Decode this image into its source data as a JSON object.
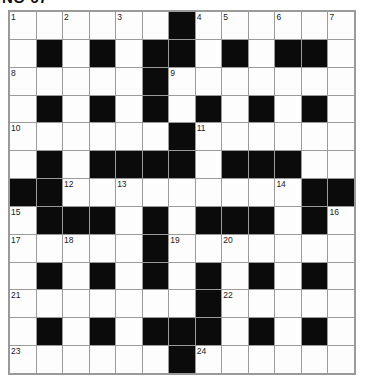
{
  "header": {
    "fragment_text": "NO 67"
  },
  "puzzle": {
    "type": "crossword-grid",
    "rows": 13,
    "cols": 13,
    "colors": {
      "block": "#0b0b0b",
      "cell": "#fdfdfd",
      "grid_line": "#9a9a9a",
      "number": "#1a1a1a"
    },
    "grid": [
      [
        0,
        0,
        0,
        0,
        0,
        0,
        1,
        0,
        0,
        0,
        0,
        0,
        0
      ],
      [
        0,
        1,
        0,
        1,
        0,
        1,
        1,
        0,
        1,
        0,
        1,
        1,
        0
      ],
      [
        0,
        0,
        0,
        0,
        0,
        1,
        0,
        0,
        0,
        0,
        0,
        0,
        0
      ],
      [
        0,
        1,
        0,
        1,
        0,
        1,
        0,
        1,
        0,
        1,
        0,
        1,
        0
      ],
      [
        0,
        0,
        0,
        0,
        0,
        0,
        1,
        0,
        0,
        0,
        0,
        0,
        0
      ],
      [
        0,
        1,
        0,
        1,
        1,
        1,
        1,
        0,
        1,
        1,
        1,
        0,
        0
      ],
      [
        1,
        1,
        0,
        0,
        0,
        0,
        0,
        0,
        0,
        0,
        0,
        1,
        1
      ],
      [
        0,
        1,
        1,
        1,
        0,
        1,
        0,
        1,
        1,
        1,
        0,
        1,
        0
      ],
      [
        0,
        0,
        0,
        0,
        0,
        1,
        0,
        0,
        0,
        0,
        0,
        0,
        0
      ],
      [
        0,
        1,
        0,
        1,
        0,
        1,
        0,
        1,
        0,
        1,
        0,
        1,
        0
      ],
      [
        0,
        0,
        0,
        0,
        0,
        0,
        0,
        1,
        0,
        0,
        0,
        0,
        0
      ],
      [
        0,
        1,
        0,
        1,
        0,
        1,
        1,
        1,
        0,
        1,
        0,
        1,
        0
      ],
      [
        0,
        0,
        0,
        0,
        0,
        0,
        1,
        0,
        0,
        0,
        0,
        0,
        0
      ]
    ],
    "numbers": [
      {
        "n": 1,
        "row": 0,
        "col": 0
      },
      {
        "n": 2,
        "row": 0,
        "col": 2
      },
      {
        "n": 3,
        "row": 0,
        "col": 4
      },
      {
        "n": 4,
        "row": 0,
        "col": 7
      },
      {
        "n": 5,
        "row": 0,
        "col": 8
      },
      {
        "n": 6,
        "row": 0,
        "col": 10
      },
      {
        "n": 7,
        "row": 0,
        "col": 12
      },
      {
        "n": 8,
        "row": 2,
        "col": 0
      },
      {
        "n": 9,
        "row": 2,
        "col": 6
      },
      {
        "n": 10,
        "row": 4,
        "col": 0
      },
      {
        "n": 11,
        "row": 4,
        "col": 7
      },
      {
        "n": 12,
        "row": 6,
        "col": 2
      },
      {
        "n": 13,
        "row": 6,
        "col": 4
      },
      {
        "n": 14,
        "row": 6,
        "col": 10
      },
      {
        "n": 15,
        "row": 7,
        "col": 0
      },
      {
        "n": 16,
        "row": 7,
        "col": 12
      },
      {
        "n": 17,
        "row": 8,
        "col": 0
      },
      {
        "n": 18,
        "row": 8,
        "col": 2
      },
      {
        "n": 19,
        "row": 8,
        "col": 6
      },
      {
        "n": 20,
        "row": 8,
        "col": 8
      },
      {
        "n": 21,
        "row": 10,
        "col": 0
      },
      {
        "n": 22,
        "row": 10,
        "col": 8
      },
      {
        "n": 23,
        "row": 12,
        "col": 0
      },
      {
        "n": 24,
        "row": 12,
        "col": 7
      }
    ]
  }
}
